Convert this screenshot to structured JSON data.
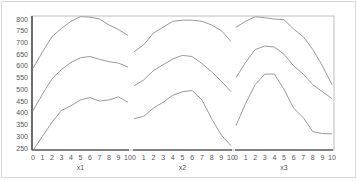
{
  "chart_data": {
    "type": "line",
    "title": "",
    "ylabel": "",
    "ylim": [
      250,
      800
    ],
    "yticks": [
      250,
      300,
      350,
      400,
      450,
      500,
      550,
      600,
      650,
      700,
      750,
      800
    ],
    "grid": false,
    "legend": null,
    "panels": [
      {
        "xlabel": "x1",
        "x": [
          0,
          1,
          2,
          3,
          4,
          5,
          6,
          7,
          8,
          9,
          10
        ],
        "series": [
          {
            "name": "upper",
            "values": [
              590,
              660,
              725,
              760,
              790,
              810,
              808,
              800,
              775,
              755,
              730
            ]
          },
          {
            "name": "middle",
            "values": [
              410,
              480,
              545,
              585,
              615,
              635,
              640,
              628,
              618,
              612,
              595
            ]
          },
          {
            "name": "lower",
            "values": [
              240,
              300,
              360,
              410,
              430,
              455,
              465,
              450,
              455,
              468,
              445
            ]
          }
        ]
      },
      {
        "xlabel": "x2",
        "x": [
          0,
          1,
          2,
          3,
          4,
          5,
          6,
          7,
          8,
          9,
          10
        ],
        "series": [
          {
            "name": "upper",
            "values": [
              660,
              690,
              740,
              765,
              790,
              795,
              795,
              790,
              775,
              750,
              705
            ]
          },
          {
            "name": "middle",
            "values": [
              515,
              540,
              580,
              605,
              630,
              645,
              640,
              610,
              575,
              535,
              490
            ]
          },
          {
            "name": "lower",
            "values": [
              375,
              385,
              420,
              445,
              475,
              490,
              495,
              455,
              375,
              305,
              260
            ]
          }
        ]
      },
      {
        "xlabel": "x3",
        "x": [
          0,
          1,
          2,
          3,
          4,
          5,
          6,
          7,
          8,
          9,
          10
        ],
        "series": [
          {
            "name": "upper",
            "values": [
              765,
              790,
              810,
              805,
              800,
              797,
              757,
              725,
              670,
              600,
              520
            ]
          },
          {
            "name": "middle",
            "values": [
              550,
              615,
              670,
              685,
              680,
              650,
              600,
              565,
              520,
              490,
              460
            ]
          },
          {
            "name": "lower",
            "values": [
              345,
              440,
              520,
              565,
              565,
              500,
              420,
              380,
              320,
              312,
              310
            ]
          }
        ]
      }
    ]
  },
  "style": {
    "line_color": "#9a9a9a",
    "axis_color": "#222222",
    "frame_color": "#bdbdbd"
  }
}
